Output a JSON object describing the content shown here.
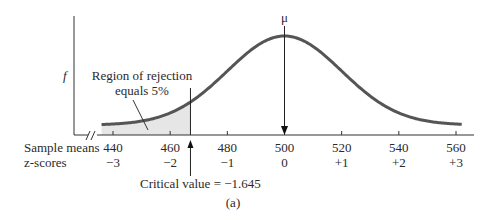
{
  "chart_data": {
    "type": "area",
    "title": "",
    "caption": "(a)",
    "distribution": "normal",
    "mean": 500,
    "sd": 20,
    "mean_label": "μ",
    "ylabel": "f",
    "xlabel_rows": [
      {
        "label": "Sample means",
        "ticks": [
          "440",
          "460",
          "480",
          "500",
          "520",
          "540",
          "560"
        ]
      },
      {
        "label": "z-scores",
        "ticks": [
          "−3",
          "−2",
          "−1",
          "0",
          "+1",
          "+2",
          "+3"
        ]
      }
    ],
    "x": [
      440,
      460,
      480,
      500,
      520,
      540,
      560
    ],
    "z": [
      -3,
      -2,
      -1,
      0,
      1,
      2,
      3
    ],
    "xlim": [
      430,
      566
    ],
    "axis_break": true,
    "critical_value": {
      "z": -1.645,
      "x": 467.1,
      "label": "Critical value = −1.645"
    },
    "rejection_region": {
      "side": "left",
      "percent": 5,
      "label_lines": [
        "Region of rejection",
        "equals 5%"
      ]
    },
    "colors": {
      "curve": "#555555",
      "shade": "#e6e6e6",
      "axis": "#333333",
      "text": "#2a2a2a"
    }
  }
}
